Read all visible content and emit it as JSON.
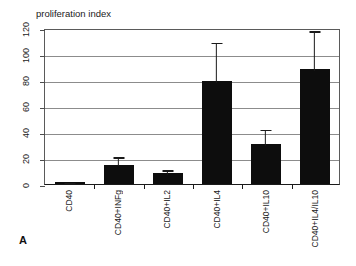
{
  "panel": {
    "letter": "A"
  },
  "chart_data": {
    "type": "bar",
    "title": "proliferation index",
    "xlabel": "",
    "ylabel": "",
    "ylim": [
      0,
      120
    ],
    "yticks": [
      0,
      20,
      40,
      60,
      80,
      100,
      120
    ],
    "ytick_labels": [
      "0",
      "20",
      "40",
      "60",
      "80",
      "100",
      "120"
    ],
    "grid": true,
    "legend": null,
    "categories": [
      "CD40",
      "CD40+INFg",
      "CD40+IL2",
      "CD40+IL4",
      "CD40+IL10",
      "CD40+IL4/IL10"
    ],
    "values": [
      1.5,
      15,
      8.5,
      79,
      31,
      88.5
    ],
    "errors_upper": [
      2.5,
      22,
      12,
      110,
      43,
      119
    ],
    "series": [
      {
        "name": "proliferation index",
        "values": [
          1.5,
          15,
          8.5,
          79,
          31,
          88.5
        ],
        "error_upper": [
          2.5,
          22,
          12,
          110,
          43,
          119
        ],
        "color": "#0d0d0d"
      }
    ]
  }
}
